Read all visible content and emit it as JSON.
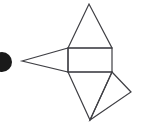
{
  "canvas": {
    "width": 142,
    "height": 133,
    "background_color": "#ffffff"
  },
  "figure": {
    "title": "geometric-line-figure",
    "stroke_color": "#3f3f44",
    "fill_color": "#1a1a1a",
    "stroke_width": 1.2,
    "parts": [
      {
        "name": "filled-disc",
        "type": "circle",
        "cx": 2,
        "cy": 62,
        "r": 10,
        "filled": true
      },
      {
        "name": "left-pointing-triangle",
        "type": "polygon",
        "points": "22,61 68,48 68,72"
      },
      {
        "name": "center-rectangle",
        "type": "rect",
        "x": 68,
        "y": 48,
        "width": 44,
        "height": 24
      },
      {
        "name": "upper-triangle",
        "type": "polygon",
        "points": "68,48 89,4 112,48"
      },
      {
        "name": "lower-triangle",
        "type": "polygon",
        "points": "68,72 90,120 112,72"
      },
      {
        "name": "right-quadrilateral",
        "type": "polygon",
        "points": "112,72 131,92 90,120"
      }
    ]
  }
}
